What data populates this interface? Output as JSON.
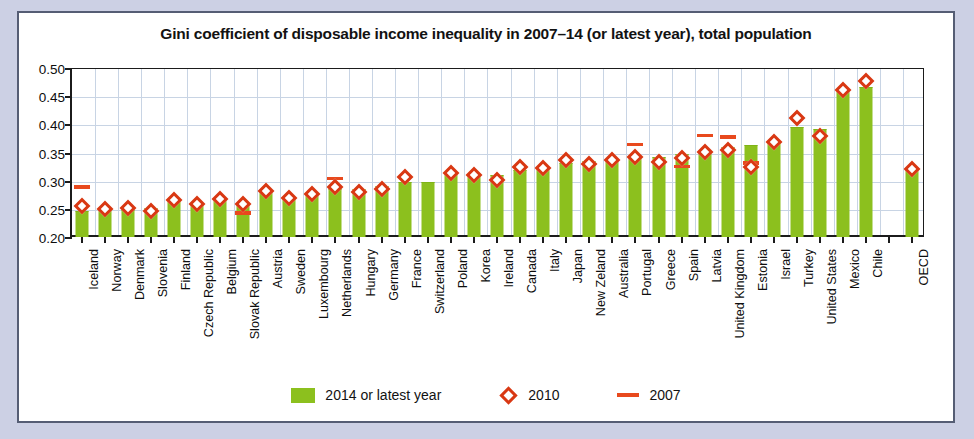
{
  "chart_data": {
    "type": "bar",
    "title": "Gini coefficient of disposable income inequality in 2007–14 (or latest year), total population",
    "xlabel": "",
    "ylabel": "",
    "ylim": [
      0.2,
      0.5
    ],
    "ytick_step": 0.05,
    "ytick_labels": [
      "0.50",
      "0.45",
      "0.40",
      "0.35",
      "0.30",
      "0.25",
      "0.20"
    ],
    "ytick_values": [
      0.5,
      0.45,
      0.4,
      0.35,
      0.3,
      0.25,
      0.2
    ],
    "grid": true,
    "legend_position": "bottom-center",
    "categories": [
      "Iceland",
      "Norway",
      "Denmark",
      "Slovenia",
      "Finland",
      "Czech Republic",
      "Belgium",
      "Slovak Republic",
      "Austria",
      "Sweden",
      "Luxembourg",
      "Netherlands",
      "Hungary",
      "Germany",
      "France",
      "Switzerland",
      "Poland",
      "Korea",
      "Ireland",
      "Canada",
      "Italy",
      "Japan",
      "New Zeland",
      "Australia",
      "Portugal",
      "Greece",
      "Spain",
      "Latvia",
      "United Kingdom",
      "Estonia",
      "Israel",
      "Turkey",
      "United States",
      "Mexico",
      "Chile",
      "",
      "OECD"
    ],
    "series": [
      {
        "name": "2014 or latest year",
        "type": "bar",
        "color": "#8cc01e",
        "values": [
          0.244,
          0.252,
          0.247,
          0.25,
          0.262,
          0.258,
          0.268,
          0.255,
          0.28,
          0.27,
          0.276,
          0.283,
          0.283,
          0.289,
          0.295,
          0.295,
          0.31,
          0.311,
          0.309,
          0.318,
          0.325,
          0.33,
          0.333,
          0.337,
          0.338,
          0.34,
          0.346,
          0.348,
          0.358,
          0.361,
          0.365,
          0.393,
          0.39,
          0.459,
          0.465,
          null,
          0.318
        ]
      },
      {
        "name": "2010",
        "type": "marker-diamond",
        "color": "#d93813",
        "values": [
          0.255,
          0.249,
          0.251,
          0.246,
          0.266,
          0.259,
          0.268,
          0.259,
          0.282,
          0.269,
          0.276,
          0.288,
          0.28,
          0.286,
          0.306,
          null,
          0.314,
          0.31,
          0.302,
          0.324,
          0.323,
          0.336,
          0.33,
          0.337,
          0.342,
          0.333,
          0.341,
          0.351,
          0.354,
          0.325,
          0.369,
          0.411,
          0.38,
          0.461,
          0.477,
          null,
          0.32
        ]
      },
      {
        "name": "2007",
        "type": "marker-dash",
        "color": "#e8491d",
        "values": [
          0.288,
          null,
          null,
          null,
          null,
          null,
          null,
          0.242,
          null,
          null,
          null,
          0.303,
          null,
          null,
          null,
          null,
          null,
          null,
          null,
          null,
          null,
          null,
          null,
          null,
          0.364,
          null,
          0.325,
          0.38,
          0.377,
          0.331,
          null,
          null,
          null,
          null,
          null,
          null,
          null
        ]
      }
    ],
    "legend": [
      {
        "label": "2014 or latest year",
        "marker": "bar",
        "color": "#8cc01e"
      },
      {
        "label": "2010",
        "marker": "diamond",
        "color": "#d93813"
      },
      {
        "label": "2007",
        "marker": "dash",
        "color": "#e8491d"
      }
    ]
  },
  "colors": {
    "bar_green": "#8cc01e",
    "marker_red": "#d93813",
    "dash_red": "#e8491d",
    "frame_border": "#555d74",
    "page_background": "#ccd0e4",
    "grid": "#c8d4e4"
  }
}
